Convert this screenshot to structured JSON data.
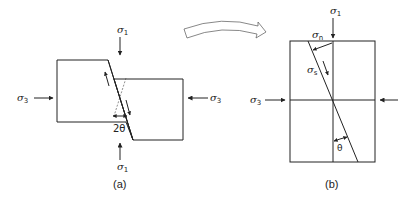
{
  "diagram": {
    "panel_a": {
      "caption": "(a)",
      "labels": {
        "sigma1_top": {
          "symbol": "σ",
          "sub": "1"
        },
        "sigma1_bottom": {
          "symbol": "σ",
          "sub": "1"
        },
        "sigma3_left": {
          "symbol": "σ",
          "sub": "3"
        },
        "sigma3_right": {
          "symbol": "σ",
          "sub": "3"
        },
        "angle": "2θ"
      }
    },
    "panel_b": {
      "caption": "(b)",
      "labels": {
        "sigma1_top": {
          "symbol": "σ",
          "sub": "1"
        },
        "sigma_n": {
          "symbol": "σ",
          "sub": "n"
        },
        "sigma_s": {
          "symbol": "σ",
          "sub": "s"
        },
        "sigma3_left": {
          "symbol": "σ",
          "sub": "3"
        },
        "angle": "θ"
      }
    },
    "transition_arrow": "curved-hollow-arrow"
  }
}
